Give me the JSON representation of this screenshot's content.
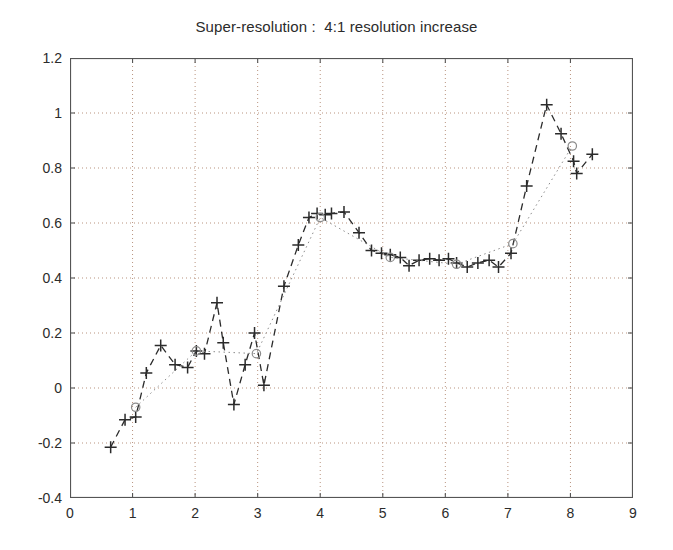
{
  "chart_data": {
    "type": "line",
    "title": "Super-resolution :  4:1 resolution increase",
    "xlabel": "",
    "ylabel": "",
    "xlim": [
      0,
      9
    ],
    "ylim": [
      -0.4,
      1.2
    ],
    "xticks": [
      0,
      1,
      2,
      3,
      4,
      5,
      6,
      7,
      8,
      9
    ],
    "yticks": [
      -0.4,
      -0.2,
      0,
      0.2,
      0.4,
      0.6,
      0.8,
      1,
      1.2
    ],
    "xtick_labels": [
      "0",
      "1",
      "2",
      "3",
      "4",
      "5",
      "6",
      "7",
      "8",
      "9"
    ],
    "ytick_labels": [
      "-0.4",
      "-0.2",
      "0",
      "0.2",
      "0.4",
      "0.6",
      "0.8",
      "1",
      "1.2"
    ],
    "grid": true,
    "grid_style": "dotted",
    "legend": null,
    "legend_position": "none",
    "colors": {
      "series_high_res": "#2b2b2b",
      "series_low_res": "#8c8c8c",
      "axis": "#555555",
      "grid": "#b9937f",
      "background": "#ffffff"
    },
    "series": [
      {
        "name": "high-resolution estimate",
        "marker": "plus",
        "line_style": "dashed",
        "color": "#2b2b2b",
        "points": [
          [
            0.65,
            -0.215
          ],
          [
            0.88,
            -0.115
          ],
          [
            1.05,
            -0.105
          ],
          [
            1.22,
            0.055
          ],
          [
            1.45,
            0.155
          ],
          [
            1.68,
            0.085
          ],
          [
            1.88,
            0.075
          ],
          [
            2.02,
            0.135
          ],
          [
            2.15,
            0.125
          ],
          [
            2.35,
            0.31
          ],
          [
            2.45,
            0.165
          ],
          [
            2.62,
            -0.06
          ],
          [
            2.8,
            0.085
          ],
          [
            2.95,
            0.2
          ],
          [
            3.1,
            0.01
          ],
          [
            3.42,
            0.37
          ],
          [
            3.65,
            0.52
          ],
          [
            3.82,
            0.62
          ],
          [
            3.95,
            0.635
          ],
          [
            4.08,
            0.63
          ],
          [
            4.18,
            0.635
          ],
          [
            4.38,
            0.64
          ],
          [
            4.62,
            0.565
          ],
          [
            4.82,
            0.5
          ],
          [
            4.98,
            0.49
          ],
          [
            5.12,
            0.485
          ],
          [
            5.28,
            0.475
          ],
          [
            5.42,
            0.445
          ],
          [
            5.58,
            0.465
          ],
          [
            5.75,
            0.47
          ],
          [
            5.9,
            0.465
          ],
          [
            6.05,
            0.47
          ],
          [
            6.18,
            0.455
          ],
          [
            6.35,
            0.44
          ],
          [
            6.52,
            0.455
          ],
          [
            6.7,
            0.465
          ],
          [
            6.85,
            0.44
          ],
          [
            7.05,
            0.49
          ],
          [
            7.3,
            0.735
          ],
          [
            7.62,
            1.03
          ],
          [
            7.85,
            0.925
          ],
          [
            8.05,
            0.825
          ],
          [
            8.1,
            0.78
          ],
          [
            8.35,
            0.85
          ]
        ]
      },
      {
        "name": "low-resolution samples",
        "marker": "circle",
        "line_style": "dotted",
        "color": "#8c8c8c",
        "points": [
          [
            1.05,
            -0.07
          ],
          [
            2.02,
            0.135
          ],
          [
            2.98,
            0.125
          ],
          [
            4.0,
            0.62
          ],
          [
            5.12,
            0.475
          ],
          [
            6.18,
            0.45
          ],
          [
            7.08,
            0.525
          ],
          [
            8.03,
            0.88
          ]
        ]
      }
    ]
  }
}
